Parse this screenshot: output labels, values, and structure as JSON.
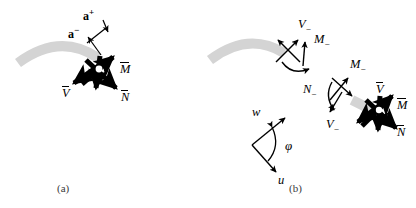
{
  "figure": {
    "width": 416,
    "height": 208,
    "background": "#ffffff",
    "ink": "#000000",
    "arc_color": "#d4d4d4",
    "caption_color": "#3a3a3a"
  },
  "panel_a": {
    "caption": "(a)",
    "labels": {
      "a_plus_base": "a",
      "a_plus_sup": "+",
      "a_minus_base": "a",
      "a_minus_sup": "−",
      "M_bar": "M",
      "N_bar": "N",
      "V_bar": "V"
    }
  },
  "panel_b": {
    "caption": "(b)",
    "labels": {
      "V_minus_top": "V",
      "V_minus_top_sub": "−",
      "M_minus_top": "M",
      "M_minus_top_sub": "−",
      "N_minus_mid": "N",
      "N_minus_mid_sub": "−",
      "V_minus_mid": "V",
      "V_minus_mid_sub": "−",
      "M_minus_mid": "M",
      "M_minus_mid_sub": "−",
      "V_bar": "V",
      "M_bar": "M",
      "N_bar": "N",
      "w": "w",
      "u": "u",
      "phi": "φ"
    }
  }
}
